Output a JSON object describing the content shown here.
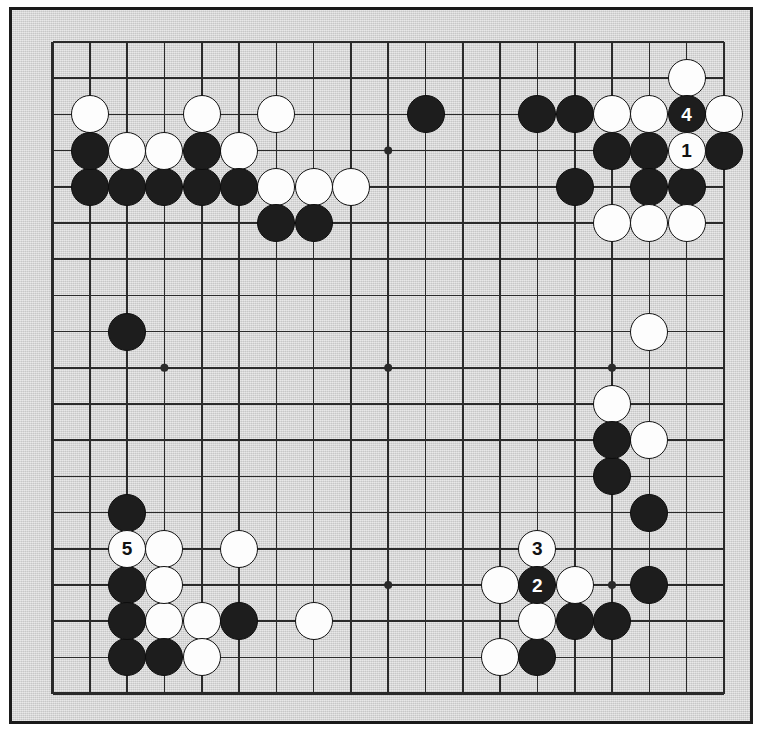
{
  "diagram": {
    "kind": "go-board-diagram",
    "board_size": 19,
    "title": "",
    "background_color": "#d5d5d5",
    "frame_color": "#1a1a1a",
    "line_color": "#2a2a2a",
    "black_stone_color": "#1d1d1d",
    "white_stone_color": "#fdfdfd"
  },
  "geometry": {
    "origin_x": 52.5,
    "origin_y": 42.0,
    "step_x": 37.3,
    "step_y": 36.2,
    "stone_diameter": 38,
    "line_width": 1.6,
    "edge_line_width": 2.4,
    "hoshi_radius": 4
  },
  "hoshi": [
    {
      "col": 4,
      "row": 4
    },
    {
      "col": 10,
      "row": 4
    },
    {
      "col": 16,
      "row": 4
    },
    {
      "col": 4,
      "row": 10
    },
    {
      "col": 10,
      "row": 10
    },
    {
      "col": 16,
      "row": 10
    },
    {
      "col": 4,
      "row": 16
    },
    {
      "col": 10,
      "row": 16
    },
    {
      "col": 16,
      "row": 16
    }
  ],
  "move_labels": [
    {
      "number": "1",
      "color": "white",
      "col": 18,
      "row": 4
    },
    {
      "number": "2",
      "color": "black",
      "col": 14,
      "row": 16
    },
    {
      "number": "3",
      "color": "white",
      "col": 14,
      "row": 15
    },
    {
      "number": "4",
      "color": "black",
      "col": 18,
      "row": 3
    },
    {
      "number": "5",
      "color": "white",
      "col": 3,
      "row": 15
    }
  ],
  "stones": [
    {
      "color": "white",
      "col": 18,
      "row": 2,
      "label": ""
    },
    {
      "color": "white",
      "col": 2,
      "row": 3,
      "label": ""
    },
    {
      "color": "white",
      "col": 5,
      "row": 3,
      "label": ""
    },
    {
      "color": "white",
      "col": 7,
      "row": 3,
      "label": ""
    },
    {
      "color": "black",
      "col": 11,
      "row": 3,
      "label": ""
    },
    {
      "color": "black",
      "col": 14,
      "row": 3,
      "label": ""
    },
    {
      "color": "black",
      "col": 15,
      "row": 3,
      "label": ""
    },
    {
      "color": "white",
      "col": 16,
      "row": 3,
      "label": ""
    },
    {
      "color": "white",
      "col": 17,
      "row": 3,
      "label": ""
    },
    {
      "color": "black",
      "col": 18,
      "row": 3,
      "label": "4"
    },
    {
      "color": "white",
      "col": 19,
      "row": 3,
      "label": ""
    },
    {
      "color": "black",
      "col": 2,
      "row": 4,
      "label": ""
    },
    {
      "color": "white",
      "col": 3,
      "row": 4,
      "label": ""
    },
    {
      "color": "white",
      "col": 4,
      "row": 4,
      "label": ""
    },
    {
      "color": "black",
      "col": 5,
      "row": 4,
      "label": ""
    },
    {
      "color": "white",
      "col": 6,
      "row": 4,
      "label": ""
    },
    {
      "color": "black",
      "col": 16,
      "row": 4,
      "label": ""
    },
    {
      "color": "black",
      "col": 17,
      "row": 4,
      "label": ""
    },
    {
      "color": "white",
      "col": 18,
      "row": 4,
      "label": "1"
    },
    {
      "color": "black",
      "col": 19,
      "row": 4,
      "label": ""
    },
    {
      "color": "black",
      "col": 2,
      "row": 5,
      "label": ""
    },
    {
      "color": "black",
      "col": 3,
      "row": 5,
      "label": ""
    },
    {
      "color": "black",
      "col": 4,
      "row": 5,
      "label": ""
    },
    {
      "color": "black",
      "col": 5,
      "row": 5,
      "label": ""
    },
    {
      "color": "black",
      "col": 6,
      "row": 5,
      "label": ""
    },
    {
      "color": "white",
      "col": 7,
      "row": 5,
      "label": ""
    },
    {
      "color": "white",
      "col": 8,
      "row": 5,
      "label": ""
    },
    {
      "color": "white",
      "col": 9,
      "row": 5,
      "label": ""
    },
    {
      "color": "black",
      "col": 15,
      "row": 5,
      "label": ""
    },
    {
      "color": "black",
      "col": 17,
      "row": 5,
      "label": ""
    },
    {
      "color": "black",
      "col": 18,
      "row": 5,
      "label": ""
    },
    {
      "color": "black",
      "col": 7,
      "row": 6,
      "label": ""
    },
    {
      "color": "black",
      "col": 8,
      "row": 6,
      "label": ""
    },
    {
      "color": "white",
      "col": 16,
      "row": 6,
      "label": ""
    },
    {
      "color": "white",
      "col": 17,
      "row": 6,
      "label": ""
    },
    {
      "color": "white",
      "col": 18,
      "row": 6,
      "label": ""
    },
    {
      "color": "black",
      "col": 3,
      "row": 9,
      "label": ""
    },
    {
      "color": "white",
      "col": 17,
      "row": 9,
      "label": ""
    },
    {
      "color": "white",
      "col": 16,
      "row": 11,
      "label": ""
    },
    {
      "color": "black",
      "col": 16,
      "row": 12,
      "label": ""
    },
    {
      "color": "white",
      "col": 17,
      "row": 12,
      "label": ""
    },
    {
      "color": "black",
      "col": 16,
      "row": 13,
      "label": ""
    },
    {
      "color": "black",
      "col": 3,
      "row": 14,
      "label": ""
    },
    {
      "color": "black",
      "col": 17,
      "row": 14,
      "label": ""
    },
    {
      "color": "white",
      "col": 3,
      "row": 15,
      "label": "5"
    },
    {
      "color": "white",
      "col": 4,
      "row": 15,
      "label": ""
    },
    {
      "color": "white",
      "col": 6,
      "row": 15,
      "label": ""
    },
    {
      "color": "white",
      "col": 14,
      "row": 15,
      "label": "3"
    },
    {
      "color": "black",
      "col": 3,
      "row": 16,
      "label": ""
    },
    {
      "color": "white",
      "col": 4,
      "row": 16,
      "label": ""
    },
    {
      "color": "white",
      "col": 13,
      "row": 16,
      "label": ""
    },
    {
      "color": "black",
      "col": 14,
      "row": 16,
      "label": "2"
    },
    {
      "color": "white",
      "col": 15,
      "row": 16,
      "label": ""
    },
    {
      "color": "black",
      "col": 17,
      "row": 16,
      "label": ""
    },
    {
      "color": "black",
      "col": 3,
      "row": 17,
      "label": ""
    },
    {
      "color": "white",
      "col": 4,
      "row": 17,
      "label": ""
    },
    {
      "color": "white",
      "col": 5,
      "row": 17,
      "label": ""
    },
    {
      "color": "black",
      "col": 6,
      "row": 17,
      "label": ""
    },
    {
      "color": "white",
      "col": 8,
      "row": 17,
      "label": ""
    },
    {
      "color": "white",
      "col": 14,
      "row": 17,
      "label": ""
    },
    {
      "color": "black",
      "col": 15,
      "row": 17,
      "label": ""
    },
    {
      "color": "black",
      "col": 16,
      "row": 17,
      "label": ""
    },
    {
      "color": "black",
      "col": 3,
      "row": 18,
      "label": ""
    },
    {
      "color": "black",
      "col": 4,
      "row": 18,
      "label": ""
    },
    {
      "color": "white",
      "col": 5,
      "row": 18,
      "label": ""
    },
    {
      "color": "white",
      "col": 13,
      "row": 18,
      "label": ""
    },
    {
      "color": "black",
      "col": 14,
      "row": 18,
      "label": ""
    }
  ]
}
